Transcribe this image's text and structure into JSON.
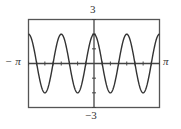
{
  "chart_data": {
    "type": "line",
    "title": "",
    "function": "y = 2cos(4x)",
    "xlabel": "",
    "ylabel": "",
    "xlim": [
      -3.14159,
      3.14159
    ],
    "ylim": [
      -3,
      3
    ],
    "x_tick_spacing": "pi/8",
    "y_tick_spacing": 1,
    "grid": false,
    "legend": null,
    "tick_labels": {
      "x_min": "−π",
      "x_max": "π",
      "y_max": "3",
      "y_min": "−3"
    },
    "series": [
      {
        "name": "2cos(4x)",
        "amplitude": 2,
        "frequency": 4,
        "phase": 0,
        "sample_points": [
          {
            "x": -3.14159,
            "y": 2
          },
          {
            "x": -2.35619,
            "y": -2
          },
          {
            "x": -1.5708,
            "y": 2
          },
          {
            "x": -0.7854,
            "y": -2
          },
          {
            "x": 0,
            "y": 2
          },
          {
            "x": 0.7854,
            "y": -2
          },
          {
            "x": 1.5708,
            "y": 2
          },
          {
            "x": 2.35619,
            "y": -2
          },
          {
            "x": 3.14159,
            "y": 2
          }
        ]
      }
    ]
  },
  "labels": {
    "y_max": "3",
    "y_min": "−3",
    "x_min": "− π",
    "x_max": "π"
  },
  "colors": {
    "frame": "#555555",
    "axes": "#444444",
    "curve": "#333333",
    "background": "#ffffff"
  }
}
